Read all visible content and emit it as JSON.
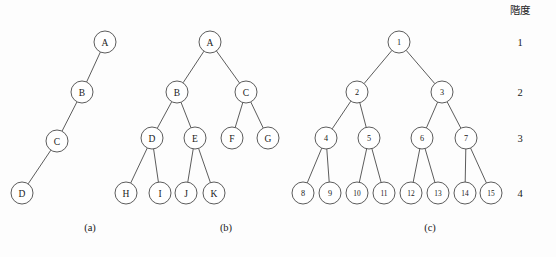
{
  "figure": {
    "background_color": "#fdfdfd",
    "stroke_color": "#4a4a4a",
    "text_color": "#1a1a1a",
    "levels_header": "階度",
    "levels": [
      {
        "label": "1",
        "x": 520,
        "y": 42
      },
      {
        "label": "2",
        "x": 520,
        "y": 92
      },
      {
        "label": "3",
        "x": 520,
        "y": 138
      },
      {
        "label": "4",
        "x": 520,
        "y": 193
      }
    ],
    "captions": [
      {
        "label": "(a)",
        "x": 90,
        "y": 231
      },
      {
        "label": "(b)",
        "x": 226,
        "y": 231
      },
      {
        "label": "(c)",
        "x": 430,
        "y": 231
      }
    ],
    "node_radius": 11,
    "trees": [
      {
        "id": "tree-a",
        "caption": "(a)",
        "nodes": [
          {
            "id": "a-A",
            "label": "A",
            "x": 105,
            "y": 42,
            "level": 1
          },
          {
            "id": "a-B",
            "label": "B",
            "x": 82,
            "y": 92,
            "level": 2
          },
          {
            "id": "a-C",
            "label": "C",
            "x": 57,
            "y": 141,
            "level": 3
          },
          {
            "id": "a-D",
            "label": "D",
            "x": 22,
            "y": 193,
            "level": 4
          }
        ],
        "edges": [
          {
            "from": "a-A",
            "to": "a-B"
          },
          {
            "from": "a-B",
            "to": "a-C"
          },
          {
            "from": "a-C",
            "to": "a-D"
          }
        ]
      },
      {
        "id": "tree-b",
        "caption": "(b)",
        "nodes": [
          {
            "id": "b-A",
            "label": "A",
            "x": 210,
            "y": 42,
            "level": 1
          },
          {
            "id": "b-B",
            "label": "B",
            "x": 177,
            "y": 92,
            "level": 2
          },
          {
            "id": "b-C",
            "label": "C",
            "x": 246,
            "y": 92,
            "level": 2
          },
          {
            "id": "b-D",
            "label": "D",
            "x": 152,
            "y": 138,
            "level": 3
          },
          {
            "id": "b-E",
            "label": "E",
            "x": 195,
            "y": 138,
            "level": 3
          },
          {
            "id": "b-F",
            "label": "F",
            "x": 232,
            "y": 138,
            "level": 3
          },
          {
            "id": "b-G",
            "label": "G",
            "x": 268,
            "y": 138,
            "level": 3
          },
          {
            "id": "b-H",
            "label": "H",
            "x": 126,
            "y": 193,
            "level": 4
          },
          {
            "id": "b-I",
            "label": "I",
            "x": 160,
            "y": 193,
            "level": 4
          },
          {
            "id": "b-J",
            "label": "J",
            "x": 186,
            "y": 193,
            "level": 4
          },
          {
            "id": "b-K",
            "label": "K",
            "x": 214,
            "y": 193,
            "level": 4
          }
        ],
        "edges": [
          {
            "from": "b-A",
            "to": "b-B"
          },
          {
            "from": "b-A",
            "to": "b-C"
          },
          {
            "from": "b-B",
            "to": "b-D"
          },
          {
            "from": "b-B",
            "to": "b-E"
          },
          {
            "from": "b-C",
            "to": "b-F"
          },
          {
            "from": "b-C",
            "to": "b-G"
          },
          {
            "from": "b-D",
            "to": "b-H"
          },
          {
            "from": "b-D",
            "to": "b-I"
          },
          {
            "from": "b-E",
            "to": "b-J"
          },
          {
            "from": "b-E",
            "to": "b-K"
          }
        ]
      },
      {
        "id": "tree-c",
        "caption": "(c)",
        "nodes": [
          {
            "id": "c-1",
            "label": "1",
            "x": 399,
            "y": 42,
            "level": 1
          },
          {
            "id": "c-2",
            "label": "2",
            "x": 357,
            "y": 92,
            "level": 2
          },
          {
            "id": "c-3",
            "label": "3",
            "x": 442,
            "y": 92,
            "level": 2
          },
          {
            "id": "c-4",
            "label": "4",
            "x": 326,
            "y": 138,
            "level": 3
          },
          {
            "id": "c-5",
            "label": "5",
            "x": 369,
            "y": 138,
            "level": 3
          },
          {
            "id": "c-6",
            "label": "6",
            "x": 422,
            "y": 138,
            "level": 3
          },
          {
            "id": "c-7",
            "label": "7",
            "x": 466,
            "y": 138,
            "level": 3
          },
          {
            "id": "c-8",
            "label": "8",
            "x": 303,
            "y": 193,
            "level": 4
          },
          {
            "id": "c-9",
            "label": "9",
            "x": 330,
            "y": 193,
            "level": 4
          },
          {
            "id": "c-10",
            "label": "10",
            "x": 357,
            "y": 193,
            "level": 4
          },
          {
            "id": "c-11",
            "label": "11",
            "x": 384,
            "y": 193,
            "level": 4
          },
          {
            "id": "c-12",
            "label": "12",
            "x": 411,
            "y": 193,
            "level": 4
          },
          {
            "id": "c-13",
            "label": "13",
            "x": 438,
            "y": 193,
            "level": 4
          },
          {
            "id": "c-14",
            "label": "14",
            "x": 465,
            "y": 193,
            "level": 4
          },
          {
            "id": "c-15",
            "label": "15",
            "x": 491,
            "y": 193,
            "level": 4
          }
        ],
        "edges": [
          {
            "from": "c-1",
            "to": "c-2"
          },
          {
            "from": "c-1",
            "to": "c-3"
          },
          {
            "from": "c-2",
            "to": "c-4"
          },
          {
            "from": "c-2",
            "to": "c-5"
          },
          {
            "from": "c-3",
            "to": "c-6"
          },
          {
            "from": "c-3",
            "to": "c-7"
          },
          {
            "from": "c-4",
            "to": "c-8"
          },
          {
            "from": "c-4",
            "to": "c-9"
          },
          {
            "from": "c-5",
            "to": "c-10"
          },
          {
            "from": "c-5",
            "to": "c-11"
          },
          {
            "from": "c-6",
            "to": "c-12"
          },
          {
            "from": "c-6",
            "to": "c-13"
          },
          {
            "from": "c-7",
            "to": "c-14"
          },
          {
            "from": "c-7",
            "to": "c-15"
          }
        ]
      }
    ]
  }
}
